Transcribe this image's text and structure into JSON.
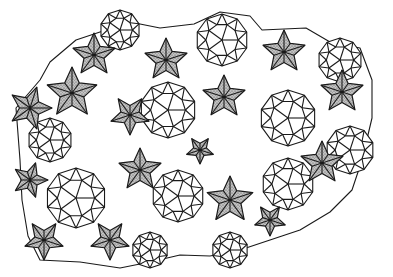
{
  "figure": {
    "title": "",
    "colors": {
      "line": "#1a1a1a",
      "background": "#ffffff",
      "stipple_base": "#bdbdbd",
      "stipple_dot": "#555555"
    },
    "stars": [
      {
        "cx": 94,
        "cy": 55,
        "r": 22,
        "rot": -90
      },
      {
        "cx": 166,
        "cy": 60,
        "r": 22,
        "rot": -90
      },
      {
        "cx": 284,
        "cy": 52,
        "r": 22,
        "rot": -90
      },
      {
        "cx": 72,
        "cy": 93,
        "r": 26,
        "rot": -90
      },
      {
        "cx": 30,
        "cy": 108,
        "r": 22,
        "rot": 0
      },
      {
        "cx": 224,
        "cy": 97,
        "r": 22,
        "rot": -90
      },
      {
        "cx": 342,
        "cy": 92,
        "r": 22,
        "rot": -90
      },
      {
        "cx": 130,
        "cy": 115,
        "r": 20,
        "rot": 90
      },
      {
        "cx": 140,
        "cy": 170,
        "r": 22,
        "rot": -90
      },
      {
        "cx": 230,
        "cy": 200,
        "r": 24,
        "rot": -90
      },
      {
        "cx": 322,
        "cy": 163,
        "r": 22,
        "rot": -90
      },
      {
        "cx": 30,
        "cy": 180,
        "r": 18,
        "rot": 0
      },
      {
        "cx": 44,
        "cy": 240,
        "r": 20,
        "rot": 90
      },
      {
        "cx": 110,
        "cy": 240,
        "r": 20,
        "rot": 90
      },
      {
        "cx": 270,
        "cy": 220,
        "r": 16,
        "rot": 90
      },
      {
        "cx": 200,
        "cy": 150,
        "r": 14,
        "rot": 90
      }
    ],
    "rosettes": [
      {
        "cx": 222,
        "cy": 40,
        "r": 26
      },
      {
        "cx": 168,
        "cy": 110,
        "r": 28
      },
      {
        "cx": 288,
        "cy": 118,
        "r": 28
      },
      {
        "cx": 76,
        "cy": 198,
        "r": 30
      },
      {
        "cx": 178,
        "cy": 196,
        "r": 26
      },
      {
        "cx": 288,
        "cy": 184,
        "r": 26
      },
      {
        "cx": 340,
        "cy": 60,
        "r": 22
      },
      {
        "cx": 120,
        "cy": 30,
        "r": 20
      },
      {
        "cx": 50,
        "cy": 140,
        "r": 22
      },
      {
        "cx": 350,
        "cy": 150,
        "r": 24
      },
      {
        "cx": 150,
        "cy": 250,
        "r": 18
      },
      {
        "cx": 230,
        "cy": 250,
        "r": 18
      }
    ],
    "outline": [
      [
        16,
        108
      ],
      [
        40,
        80
      ],
      [
        50,
        62
      ],
      [
        76,
        40
      ],
      [
        130,
        22
      ],
      [
        160,
        28
      ],
      [
        194,
        24
      ],
      [
        220,
        12
      ],
      [
        250,
        16
      ],
      [
        262,
        30
      ],
      [
        306,
        28
      ],
      [
        330,
        42
      ],
      [
        360,
        48
      ],
      [
        372,
        80
      ],
      [
        372,
        118
      ],
      [
        362,
        160
      ],
      [
        352,
        190
      ],
      [
        330,
        212
      ],
      [
        300,
        230
      ],
      [
        270,
        240
      ],
      [
        240,
        250
      ],
      [
        210,
        256
      ],
      [
        180,
        255
      ],
      [
        150,
        262
      ],
      [
        120,
        268
      ],
      [
        80,
        262
      ],
      [
        40,
        260
      ],
      [
        28,
        236
      ],
      [
        22,
        200
      ],
      [
        20,
        160
      ]
    ]
  }
}
